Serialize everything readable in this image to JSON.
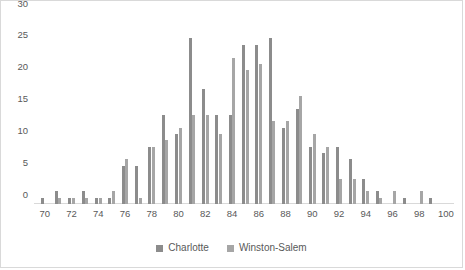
{
  "chart_data": {
    "type": "bar",
    "title": "",
    "subtitle": "",
    "xlabel": "",
    "ylabel": "",
    "grid": false,
    "legend_position": "bottom",
    "xlim": [
      69.2,
      100.6
    ],
    "ylim": [
      0,
      30
    ],
    "ytick_values": [
      0,
      5,
      10,
      15,
      20,
      25,
      30
    ],
    "ytick_labels": [
      "0",
      "5",
      "10",
      "15",
      "20",
      "25",
      "30"
    ],
    "xtick_values": [
      70,
      72,
      74,
      76,
      78,
      80,
      82,
      84,
      86,
      88,
      90,
      92,
      94,
      96,
      98,
      100
    ],
    "xtick_labels": [
      "70",
      "72",
      "74",
      "76",
      "78",
      "80",
      "82",
      "84",
      "86",
      "88",
      "90",
      "92",
      "94",
      "96",
      "98",
      "100"
    ],
    "categories": [
      70,
      71,
      72,
      73,
      74,
      75,
      76,
      77,
      78,
      79,
      80,
      81,
      82,
      83,
      84,
      85,
      86,
      87,
      88,
      89,
      90,
      91,
      92,
      93,
      94,
      95,
      96,
      97,
      98,
      99,
      100
    ],
    "series": [
      {
        "name": "Charlotte",
        "color": "#8c8c8c",
        "values": [
          1,
          2,
          1,
          2,
          1,
          1,
          6,
          6,
          9,
          14,
          11,
          26,
          18,
          14,
          14,
          25,
          25,
          26,
          12,
          15,
          9,
          8,
          9,
          7,
          4,
          2,
          0,
          1,
          0,
          1,
          0
        ]
      },
      {
        "name": "Winston-Salem",
        "color": "#a6a6a6",
        "values": [
          0,
          1,
          1,
          1,
          1,
          2,
          7,
          1,
          9,
          10,
          12,
          14,
          14,
          11,
          23,
          21,
          22,
          13,
          13,
          17,
          11,
          9,
          4,
          4,
          2,
          1,
          2,
          0,
          2,
          0,
          0
        ]
      }
    ]
  },
  "legend": {
    "items": [
      {
        "label": "Charlotte",
        "color": "#8c8c8c"
      },
      {
        "label": "Winston-Salem",
        "color": "#a6a6a6"
      }
    ]
  }
}
